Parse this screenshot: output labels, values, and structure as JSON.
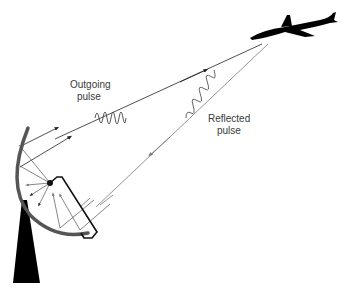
{
  "diagram": {
    "labels": {
      "outgoing_line1": "Outgoing",
      "outgoing_line2": "pulse",
      "reflected_line1": "Reflected",
      "reflected_line2": "pulse"
    },
    "elements": {
      "antenna": "parabolic-dish",
      "tower": "support-tower",
      "target": "airplane"
    },
    "colors": {
      "outgoing": "#222222",
      "reflected": "#777777",
      "dish": "#555555",
      "silhouette": "#000000"
    }
  }
}
